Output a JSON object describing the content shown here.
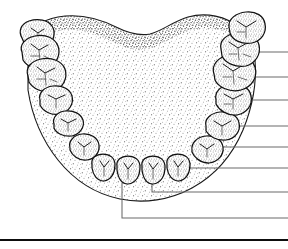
{
  "figure": {
    "background_color": "#ffffff",
    "ink_color": "#111111",
    "stipple_color": "#333333",
    "leader_color": "#6a6a6a",
    "rule_color": "#0d0d0d",
    "width": 288,
    "height": 249
  },
  "arch": {
    "name": "mandibular-arch-body",
    "outline_label": "tongue and floor of mouth",
    "posterior_border_label": "wavy posterior border",
    "path": "M 28 46 C 30 30 40 20 58 17 C 80 13 100 19 116 27 C 128 33 140 36 150 34 C 162 31 172 22 188 17 C 206 12 226 16 240 28 C 250 37 254 48 255 60 C 257 84 252 108 243 130 C 232 156 214 176 192 188 C 170 200 144 204 120 199 C 96 194 74 180 58 160 C 42 140 32 116 28 90 Z",
    "shade_path": "M 28 46 C 30 30 40 20 58 17 C 80 13 100 19 116 27 C 128 33 140 36 150 34 C 162 31 172 22 188 17 C 206 12 226 16 240 28 C 248 35 252 43 254 52 C 244 40 226 28 206 28 C 186 28 170 40 156 46 C 144 51 134 51 122 46 C 106 39 88 28 66 30 C 46 32 34 38 28 46 Z"
  },
  "teeth": {
    "count": 16,
    "quadrants": [
      "left",
      "right"
    ],
    "items": [
      {
        "id": "left-third-molar",
        "name": "tooth-left-third-molar",
        "type": "molar",
        "side": "left",
        "path": "M 22 38 C 18 31 21 24 29 21 C 38 18 48 20 52 26 C 56 32 54 41 48 46 C 41 51 31 49 25 45 Z",
        "fissures": [
          "M 31 28 L 38 33 L 44 29",
          "M 38 33 L 37 41",
          "M 31 37 L 36 38"
        ]
      },
      {
        "id": "left-second-molar",
        "name": "tooth-left-second-molar",
        "type": "molar",
        "side": "left",
        "path": "M 22 52 C 19 45 25 38 35 36 C 46 34 55 38 58 46 C 61 54 57 64 48 68 C 38 71 27 67 23 60 Z",
        "fissures": [
          "M 31 44 L 39 50 L 48 45",
          "M 39 50 L 40 61",
          "M 31 56 L 39 56",
          "M 44 56 L 50 59"
        ]
      },
      {
        "id": "left-first-molar",
        "name": "tooth-left-first-molar",
        "type": "molar",
        "side": "left",
        "path": "M 28 76 C 25 68 31 61 41 59 C 52 57 62 61 65 69 C 68 78 63 88 54 91 C 44 94 33 89 29 82 Z",
        "fissures": [
          "M 37 67 L 45 73 L 55 68",
          "M 45 73 L 46 85",
          "M 37 79 L 45 79",
          "M 50 79 L 57 82"
        ]
      },
      {
        "id": "left-second-premolar",
        "name": "tooth-left-second-premolar",
        "type": "premolar",
        "side": "left",
        "path": "M 40 100 C 38 93 44 87 53 86 C 62 85 70 89 72 96 C 74 104 69 112 60 114 C 51 116 43 111 40 105 Z",
        "fissures": [
          "M 48 95 L 56 99 L 65 95",
          "M 56 99 L 56 108"
        ]
      },
      {
        "id": "left-first-premolar",
        "name": "tooth-left-first-premolar",
        "type": "premolar",
        "side": "left",
        "path": "M 54 124 C 52 118 57 112 65 111 C 74 110 81 114 83 120 C 85 127 80 134 72 136 C 63 137 56 133 54 128 Z",
        "fissures": [
          "M 61 119 L 68 123 L 76 119",
          "M 68 123 L 68 131"
        ]
      },
      {
        "id": "left-canine",
        "name": "tooth-left-canine",
        "type": "canine",
        "side": "left",
        "path": "M 70 148 C 68 141 74 135 82 134 C 91 133 98 138 99 145 C 100 152 95 159 87 160 C 78 161 72 155 70 150 Z",
        "fissures": [
          "M 78 142 L 84 147 L 91 142",
          "M 84 147 L 84 155"
        ]
      },
      {
        "id": "left-lateral-incisor",
        "name": "tooth-left-lateral-incisor",
        "type": "incisor",
        "side": "left",
        "path": "M 92 164 C 91 158 96 154 103 154 C 110 154 115 158 115 165 C 115 173 111 180 104 181 C 97 181 93 175 92 168 Z",
        "fissures": [
          "M 100 161 L 104 167 L 109 161",
          "M 104 167 L 104 176"
        ]
      },
      {
        "id": "left-central-incisor",
        "name": "tooth-left-central-incisor",
        "type": "incisor",
        "side": "left",
        "path": "M 117 166 C 116 160 121 156 128 156 C 135 156 140 160 140 167 C 140 176 136 183 128 184 C 121 184 118 177 117 170 Z",
        "fissures": [
          "M 124 163 L 128 169 L 133 163",
          "M 128 169 L 128 179"
        ]
      },
      {
        "id": "right-central-incisor",
        "name": "tooth-right-central-incisor",
        "type": "incisor",
        "side": "right",
        "path": "M 142 166 C 141 160 146 156 153 156 C 160 156 165 160 165 167 C 165 176 161 183 153 184 C 146 184 143 177 142 170 Z",
        "fissures": [
          "M 149 163 L 153 169 L 158 163",
          "M 153 169 L 153 179"
        ]
      },
      {
        "id": "right-lateral-incisor",
        "name": "tooth-right-lateral-incisor",
        "type": "incisor",
        "side": "right",
        "path": "M 167 164 C 166 158 171 154 178 154 C 185 154 190 158 190 165 C 190 173 186 180 179 181 C 172 181 168 175 167 168 Z",
        "fissures": [
          "M 174 161 L 178 167 L 183 161",
          "M 178 167 L 178 176"
        ]
      },
      {
        "id": "right-canine",
        "name": "tooth-right-canine",
        "type": "canine",
        "side": "right",
        "path": "M 192 150 C 191 143 197 137 206 136 C 215 135 222 140 223 147 C 224 155 218 162 209 163 C 200 163 194 157 192 152 Z",
        "fissures": [
          "M 200 144 L 207 149 L 214 144",
          "M 207 149 L 207 157"
        ]
      },
      {
        "id": "right-first-premolar",
        "name": "tooth-right-first-premolar",
        "type": "premolar",
        "side": "right",
        "path": "M 206 126 C 204 119 211 113 220 112 C 230 111 238 116 239 123 C 241 131 235 139 226 140 C 216 141 209 136 206 131 Z",
        "fissures": [
          "M 214 121 L 222 126 L 231 121",
          "M 222 126 L 222 135"
        ]
      },
      {
        "id": "right-second-premolar",
        "name": "tooth-right-second-premolar",
        "type": "premolar",
        "side": "right",
        "path": "M 216 100 C 214 92 221 85 231 84 C 241 83 250 88 251 96 C 253 105 247 113 237 115 C 227 116 219 110 216 104 Z",
        "fissures": [
          "M 224 94 L 233 99 L 243 94",
          "M 233 99 L 233 109",
          "M 224 104 L 231 104"
        ]
      },
      {
        "id": "right-first-molar",
        "name": "tooth-right-first-molar",
        "type": "molar",
        "side": "right",
        "path": "M 214 74 C 211 65 218 57 229 55 C 241 53 252 58 255 67 C 258 77 252 87 241 90 C 230 93 218 87 215 80 Z",
        "fissures": [
          "M 223 64 L 233 71 L 245 64",
          "M 233 71 L 234 84",
          "M 223 77 L 232 77",
          "M 238 77 L 247 80"
        ]
      },
      {
        "id": "right-second-molar",
        "name": "tooth-right-second-molar",
        "type": "molar",
        "side": "right",
        "path": "M 221 49 C 219 41 226 34 237 33 C 248 32 257 37 259 45 C 261 54 256 63 246 66 C 236 68 225 63 222 56 Z",
        "fissures": [
          "M 229 42 L 238 48 L 249 42",
          "M 238 48 L 239 60",
          "M 229 54 L 237 54",
          "M 243 54 L 251 57"
        ]
      },
      {
        "id": "right-third-molar",
        "name": "tooth-right-third-molar",
        "type": "molar",
        "side": "right",
        "path": "M 229 27 C 228 19 236 13 246 12 C 256 11 264 16 265 24 C 267 33 261 41 252 43 C 242 45 232 40 230 33 Z",
        "fissures": [
          "M 237 21 L 246 27 L 256 21",
          "M 246 27 L 246 38",
          "M 237 32 L 245 32"
        ]
      }
    ]
  },
  "leaders": {
    "count": 8,
    "end_x": 288,
    "items": [
      {
        "id": "leader-1",
        "name": "leader-line-right-second-molar",
        "points": "254 52 L 288 52",
        "target_tooth": "right-second-molar"
      },
      {
        "id": "leader-2",
        "name": "leader-line-right-first-molar",
        "points": "250 77 L 288 77",
        "target_tooth": "right-first-molar"
      },
      {
        "id": "leader-3",
        "name": "leader-line-right-second-premolar",
        "points": "241 100 L 288 100",
        "target_tooth": "right-second-premolar"
      },
      {
        "id": "leader-4",
        "name": "leader-line-right-first-premolar",
        "points": "229 126 L 288 126",
        "target_tooth": "right-first-premolar"
      },
      {
        "id": "leader-5",
        "name": "leader-line-right-canine",
        "points": "212 147 L 288 147",
        "target_tooth": "right-canine"
      },
      {
        "id": "leader-6",
        "name": "leader-line-right-lateral-incisor",
        "points": "186 168 L 288 168",
        "target_tooth": "right-lateral-incisor"
      },
      {
        "id": "leader-7",
        "name": "leader-line-right-central-incisor",
        "points": "152 183 L 152 192 L 288 192",
        "target_tooth": "right-central-incisor"
      },
      {
        "id": "leader-8",
        "name": "leader-line-left-central-incisor",
        "points": "122 183 L 122 218 L 288 218",
        "target_tooth": "left-central-incisor"
      }
    ]
  },
  "baseline": {
    "name": "page-baseline-rule",
    "y": 240,
    "x_start": 0,
    "x_end": 288
  }
}
